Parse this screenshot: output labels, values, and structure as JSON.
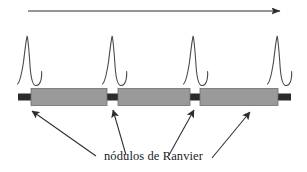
{
  "figure": {
    "title_caption": "nódulos de Ranvier",
    "colors": {
      "background": "#ffffff",
      "axon_core": "#2b2b2b",
      "myelin_fill": "#9a9a9a",
      "myelin_stroke": "#6e6e6e",
      "line": "#2d2d2d",
      "spike_stroke": "#4a4a4a",
      "text": "#1c1c1c"
    },
    "direction_arrow": {
      "name": "propagation-direction-arrow",
      "x1": 28,
      "y1": 11,
      "x2": 280,
      "y2": 11,
      "head": "right"
    },
    "axon": {
      "name": "myelinated-axon",
      "x_start": 18,
      "x_end": 291,
      "y_center": 97,
      "core_height": 7,
      "myelin_height": 17
    },
    "myelin_segments": [
      {
        "label": "myelin-sheath-1",
        "x": 31,
        "width": 76
      },
      {
        "label": "myelin-sheath-2",
        "x": 118,
        "width": 72
      },
      {
        "label": "myelin-sheath-3",
        "x": 200,
        "width": 78
      }
    ],
    "nodes_of_ranvier": [
      {
        "label": "node-1",
        "x": 107,
        "width": 11
      },
      {
        "label": "node-2",
        "x": 190,
        "width": 10
      },
      {
        "label": "node-3",
        "x": 278,
        "width": 13
      },
      {
        "label": "node-0",
        "x": 18,
        "width": 13
      }
    ],
    "action_potentials": [
      {
        "label": "action-potential-spike-1",
        "x": 27,
        "peak_y": 36,
        "baseline_y": 84
      },
      {
        "label": "action-potential-spike-2",
        "x": 112,
        "peak_y": 36,
        "baseline_y": 84
      },
      {
        "label": "action-potential-spike-3",
        "x": 193,
        "peak_y": 36,
        "baseline_y": 84
      },
      {
        "label": "action-potential-spike-4",
        "x": 277,
        "peak_y": 36,
        "baseline_y": 84
      }
    ],
    "pointer_arrows": [
      {
        "label": "pointer-arrow-1",
        "x1": 96,
        "y1": 156,
        "x2": 32,
        "y2": 111
      },
      {
        "label": "pointer-arrow-2",
        "x1": 126,
        "y1": 155,
        "x2": 113,
        "y2": 110
      },
      {
        "label": "pointer-arrow-3",
        "x1": 169,
        "y1": 155,
        "x2": 194,
        "y2": 110
      },
      {
        "label": "pointer-arrow-4",
        "x1": 212,
        "y1": 158,
        "x2": 250,
        "y2": 112
      }
    ]
  }
}
